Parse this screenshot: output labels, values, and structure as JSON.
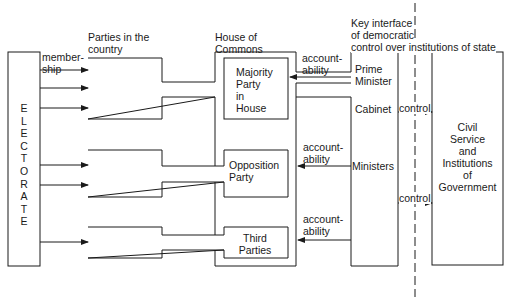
{
  "headers": {
    "parties_in_country": [
      "Parties in the",
      "country"
    ],
    "house_of_commons": [
      "House of",
      "Commons"
    ],
    "key_interface": [
      "Key interface",
      "of democratic",
      "control over institutions of state"
    ]
  },
  "electorate": {
    "label": "E\nL\nE\nC\nT\nO\nR\nA\nT\nE"
  },
  "membership_label": [
    "member-",
    "ship"
  ],
  "house_parties": {
    "majority": [
      "Majority",
      "Party",
      "in",
      "House"
    ],
    "opposition": [
      "Opposition",
      "Party"
    ],
    "third": [
      "Third",
      "Parties"
    ]
  },
  "accountability_label": [
    "account-",
    "ability"
  ],
  "government": {
    "prime_minister": [
      "Prime",
      "Minister"
    ],
    "cabinet": "Cabinet",
    "ministers": "Ministers"
  },
  "control_label": "control",
  "civil_service": [
    "Civil",
    "Service",
    "and",
    "Institutions",
    "of",
    "Government"
  ],
  "colors": {
    "line": "#1a1a1a",
    "background": "#ffffff"
  }
}
